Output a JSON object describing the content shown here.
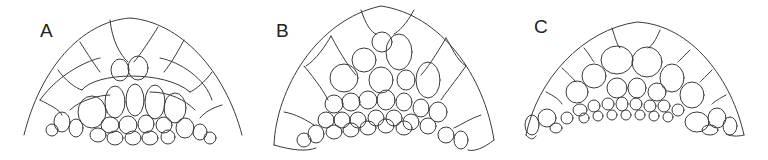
{
  "figure": {
    "panels": [
      {
        "id": "A",
        "label": "A",
        "description": "Dome-shaped cellular section with outer layered cells and inner irregular cells"
      },
      {
        "id": "B",
        "label": "B",
        "description": "Taller dome section with large outer cells and small inner cells along base"
      },
      {
        "id": "C",
        "label": "C",
        "description": "Broad flattened dome section with many small cells along base"
      }
    ],
    "colors": {
      "line": "#3a3a3a",
      "background": "#ffffff"
    }
  }
}
